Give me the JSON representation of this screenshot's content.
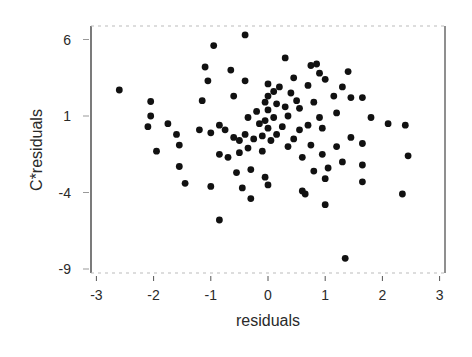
{
  "chart_data": {
    "type": "scatter",
    "title": "",
    "xlabel": "residuals",
    "ylabel": "C*residuals",
    "xlim": [
      -3.05,
      3.05
    ],
    "ylim": [
      -9.15,
      6.35
    ],
    "xticks": [
      -3,
      -2,
      -1,
      0,
      1,
      2,
      3
    ],
    "yticks": [
      6,
      1,
      -4,
      -9
    ],
    "grid": false,
    "legend": null,
    "marker_color": "#111111",
    "points": [
      [
        -2.6,
        2.7
      ],
      [
        -2.05,
        1.95
      ],
      [
        -2.05,
        1.0
      ],
      [
        -2.1,
        0.3
      ],
      [
        -1.95,
        -1.3
      ],
      [
        -1.75,
        0.5
      ],
      [
        -1.6,
        -0.2
      ],
      [
        -1.55,
        -0.9
      ],
      [
        -1.55,
        -2.3
      ],
      [
        -1.45,
        -3.4
      ],
      [
        -1.2,
        0.1
      ],
      [
        -1.15,
        2.0
      ],
      [
        -1.1,
        4.2
      ],
      [
        -1.05,
        3.3
      ],
      [
        -1.0,
        -0.1
      ],
      [
        -1.0,
        -3.6
      ],
      [
        -0.95,
        5.6
      ],
      [
        -0.85,
        0.4
      ],
      [
        -0.85,
        -1.5
      ],
      [
        -0.85,
        -5.8
      ],
      [
        -0.75,
        0.1
      ],
      [
        -0.7,
        -1.7
      ],
      [
        -0.65,
        4.0
      ],
      [
        -0.6,
        -0.4
      ],
      [
        -0.6,
        2.3
      ],
      [
        -0.55,
        -2.7
      ],
      [
        -0.5,
        -0.6
      ],
      [
        -0.5,
        -1.4
      ],
      [
        -0.45,
        -3.7
      ],
      [
        -0.4,
        6.3
      ],
      [
        -0.4,
        3.3
      ],
      [
        -0.4,
        -0.2
      ],
      [
        -0.35,
        0.9
      ],
      [
        -0.35,
        -1.1
      ],
      [
        -0.3,
        -2.5
      ],
      [
        -0.3,
        -4.4
      ],
      [
        -0.25,
        -0.5
      ],
      [
        -0.2,
        1.3
      ],
      [
        -0.15,
        0.5
      ],
      [
        -0.1,
        -0.3
      ],
      [
        -0.1,
        -1.3
      ],
      [
        -0.05,
        1.9
      ],
      [
        -0.05,
        0.7
      ],
      [
        -0.05,
        -3.0
      ],
      [
        0.0,
        3.1
      ],
      [
        0.0,
        2.3
      ],
      [
        0.0,
        1.4
      ],
      [
        0.0,
        0.2
      ],
      [
        0.0,
        -3.5
      ],
      [
        0.05,
        -0.6
      ],
      [
        0.1,
        2.6
      ],
      [
        0.1,
        0.9
      ],
      [
        0.15,
        1.8
      ],
      [
        0.15,
        -0.2
      ],
      [
        0.2,
        2.9
      ],
      [
        0.25,
        0.3
      ],
      [
        0.3,
        4.8
      ],
      [
        0.3,
        1.6
      ],
      [
        0.35,
        1.0
      ],
      [
        0.35,
        -1.0
      ],
      [
        0.4,
        2.5
      ],
      [
        0.45,
        3.5
      ],
      [
        0.45,
        -0.5
      ],
      [
        0.5,
        2.0
      ],
      [
        0.55,
        1.5
      ],
      [
        0.55,
        0.1
      ],
      [
        0.6,
        -1.7
      ],
      [
        0.6,
        -3.9
      ],
      [
        0.65,
        -4.1
      ],
      [
        0.7,
        3.0
      ],
      [
        0.7,
        0.4
      ],
      [
        0.75,
        -0.9
      ],
      [
        0.75,
        4.3
      ],
      [
        0.8,
        1.9
      ],
      [
        0.8,
        -2.6
      ],
      [
        0.85,
        4.4
      ],
      [
        0.9,
        0.9
      ],
      [
        0.9,
        3.8
      ],
      [
        0.95,
        -1.5
      ],
      [
        0.95,
        0.2
      ],
      [
        1.0,
        3.4
      ],
      [
        1.0,
        -3.1
      ],
      [
        1.0,
        -4.8
      ],
      [
        1.05,
        -2.4
      ],
      [
        1.15,
        2.3
      ],
      [
        1.2,
        1.2
      ],
      [
        1.2,
        -1.0
      ],
      [
        1.3,
        2.9
      ],
      [
        1.3,
        -2.0
      ],
      [
        1.35,
        -8.3
      ],
      [
        1.4,
        3.9
      ],
      [
        1.45,
        2.2
      ],
      [
        1.45,
        -0.4
      ],
      [
        1.65,
        2.2
      ],
      [
        1.65,
        -0.8
      ],
      [
        1.65,
        -2.2
      ],
      [
        1.65,
        -3.3
      ],
      [
        1.8,
        0.9
      ],
      [
        2.1,
        0.5
      ],
      [
        2.35,
        -4.1
      ],
      [
        2.4,
        0.4
      ],
      [
        2.45,
        -1.6
      ]
    ]
  },
  "axes": {
    "x_label": "residuals",
    "y_label": "C*residuals",
    "x_tick_labels": [
      "-3",
      "-2",
      "-1",
      "0",
      "1",
      "2",
      "3"
    ],
    "y_tick_labels": [
      "6",
      "1",
      "-4",
      "-9"
    ]
  }
}
